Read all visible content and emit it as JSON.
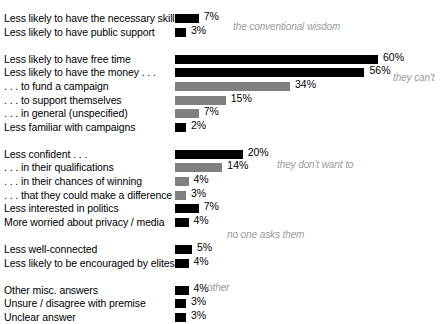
{
  "chart_data": {
    "type": "bar",
    "title": "",
    "subtitle": "",
    "xlabel": "",
    "ylabel": "",
    "grid": false,
    "orientation": "horizontal",
    "xlim": [
      0,
      60
    ],
    "value_suffix": "%",
    "colors": {
      "primary_bar": "#000000",
      "secondary_bar": "#808080",
      "annotation_text": "#9a9a9a",
      "label_text": "#000000",
      "background": "#ffffff"
    },
    "categories": [
      "Less likely to have the necessary skills",
      "Less likely to have public support",
      "Less likely to have free time",
      "Less likely to have the money . . .",
      ". . . to fund a campaign",
      ". . . to support themselves",
      ". . . in general (unspecified)",
      "Less familiar with campaigns",
      "Less confident . . .",
      ". . . in their qualifications",
      ". . . in their chances of winning",
      ". . . that they could make a difference",
      "Less interested in politics",
      "More worried about privacy / media",
      "Less well-connected",
      "Less likely to be encouraged by elites",
      "Other misc. answers",
      "Unsure / disagree with premise",
      "Unclear answer"
    ],
    "values": [
      7,
      3,
      60,
      56,
      34,
      15,
      7,
      2,
      20,
      14,
      4,
      3,
      7,
      4,
      5,
      4,
      4,
      3,
      3
    ],
    "groups": [
      {
        "annotation": "the conventional wisdom",
        "rows": [
          {
            "label": "Less likely to have the necessary skills",
            "value": 7,
            "display": "7%",
            "shade": "black"
          },
          {
            "label": "Less likely to have public support",
            "value": 3,
            "display": "3%",
            "shade": "black"
          }
        ]
      },
      {
        "annotation": "they can't",
        "rows": [
          {
            "label": "Less likely to have free time",
            "value": 60,
            "display": "60%",
            "shade": "black"
          },
          {
            "label": "Less likely to have the money . . .",
            "value": 56,
            "display": "56%",
            "shade": "black"
          },
          {
            "label": ". . . to fund a campaign",
            "value": 34,
            "display": "34%",
            "shade": "gray"
          },
          {
            "label": ". . . to support themselves",
            "value": 15,
            "display": "15%",
            "shade": "gray"
          },
          {
            "label": ". . . in general (unspecified)",
            "value": 7,
            "display": "7%",
            "shade": "gray"
          },
          {
            "label": "Less familiar with campaigns",
            "value": 2,
            "display": "2%",
            "shade": "black"
          }
        ]
      },
      {
        "annotation": "they don't want to",
        "rows": [
          {
            "label": "Less confident . . .",
            "value": 20,
            "display": "20%",
            "shade": "black"
          },
          {
            "label": ". . . in their qualifications",
            "value": 14,
            "display": "14%",
            "shade": "gray"
          },
          {
            "label": ". . . in their chances of winning",
            "value": 4,
            "display": "4%",
            "shade": "gray"
          },
          {
            "label": ". . . that they could make a difference",
            "value": 3,
            "display": "3%",
            "shade": "gray"
          },
          {
            "label": "Less interested in politics",
            "value": 7,
            "display": "7%",
            "shade": "black"
          },
          {
            "label": "More worried about privacy / media",
            "value": 4,
            "display": "4%",
            "shade": "black"
          }
        ]
      },
      {
        "annotation": "no one asks them",
        "rows": [
          {
            "label": "Less well-connected",
            "value": 5,
            "display": "5%",
            "shade": "black"
          },
          {
            "label": "Less likely to be encouraged by elites",
            "value": 4,
            "display": "4%",
            "shade": "black"
          }
        ]
      },
      {
        "annotation": "other",
        "rows": [
          {
            "label": "Other misc. answers",
            "value": 4,
            "display": "4%",
            "shade": "black"
          },
          {
            "label": "Unsure / disagree with premise",
            "value": 3,
            "display": "3%",
            "shade": "black"
          },
          {
            "label": "Unclear answer",
            "value": 3,
            "display": "3%",
            "shade": "black"
          }
        ]
      }
    ],
    "annotations": [
      {
        "text": "the conventional wisdom",
        "group_index": 0,
        "x": 233,
        "y": 20
      },
      {
        "text": "they can't",
        "group_index": 1,
        "x": 393,
        "y": 71
      },
      {
        "text": "they don't want to",
        "group_index": 2,
        "x": 277,
        "y": 158
      },
      {
        "text": "no one asks them",
        "group_index": 3,
        "x": 227,
        "y": 228
      },
      {
        "text": "other",
        "group_index": 4,
        "x": 207,
        "y": 281
      }
    ]
  }
}
